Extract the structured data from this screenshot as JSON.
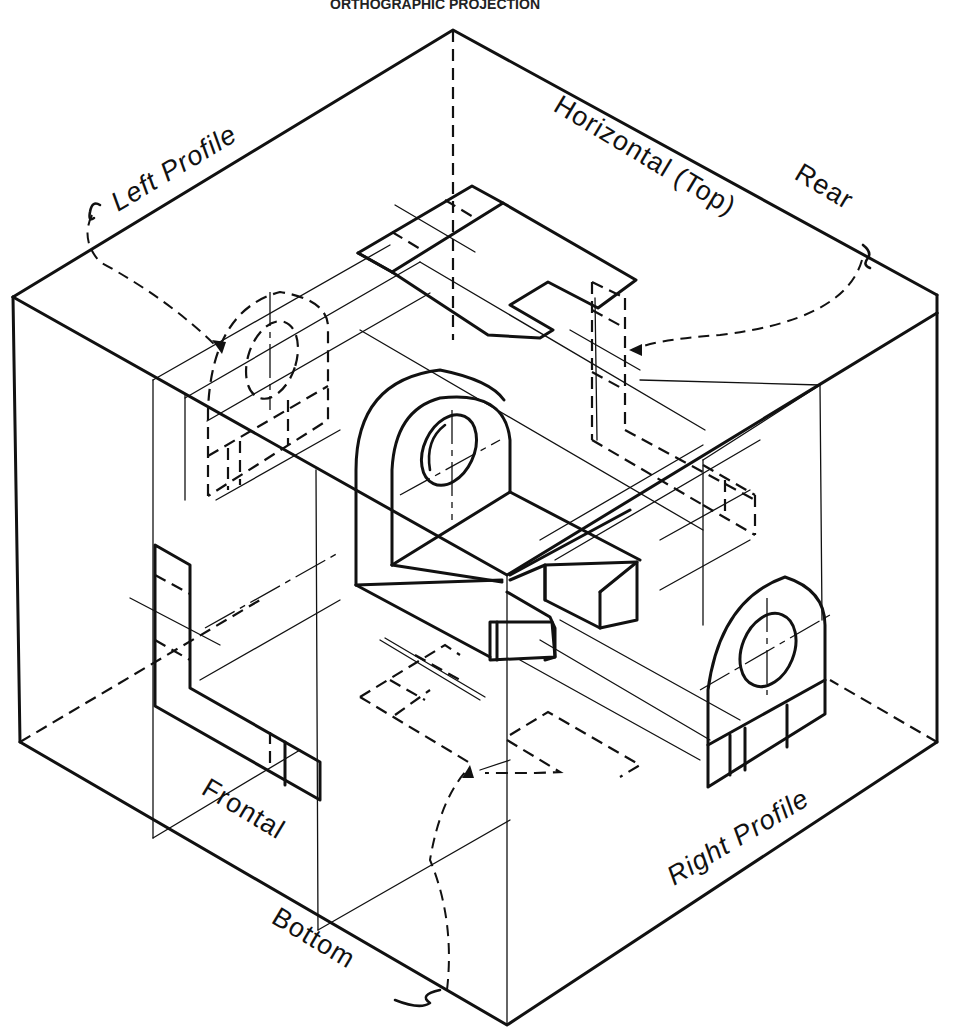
{
  "figure": {
    "caption_partial": "ORTHOGRAPHIC PROJECTION",
    "type": "glass-box orthographic projection diagram",
    "line_color": "#111111",
    "background": "#ffffff"
  },
  "planes": {
    "left_profile": "Left Profile",
    "horizontal_top": "Horizontal (Top)",
    "rear": "Rear",
    "frontal": "Frontal",
    "bottom": "Bottom",
    "right_profile": "Right Profile"
  },
  "views": [
    {
      "name": "top-view",
      "plane": "Horizontal (Top)"
    },
    {
      "name": "left-profile-view",
      "plane": "Left Profile",
      "linetype": "hidden"
    },
    {
      "name": "rear-view",
      "plane": "Rear",
      "linetype": "hidden"
    },
    {
      "name": "front-view",
      "plane": "Frontal"
    },
    {
      "name": "right-profile-view",
      "plane": "Right Profile"
    },
    {
      "name": "bottom-view",
      "plane": "Bottom",
      "linetype": "hidden"
    }
  ],
  "object": {
    "description": "L-shaped bracket with upright rounded tab containing a circular hole, and a slotted base"
  }
}
